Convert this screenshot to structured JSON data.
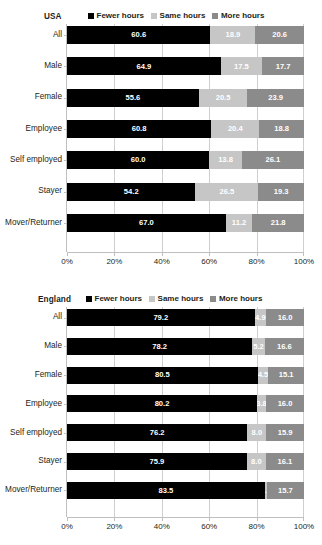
{
  "legend": {
    "items": [
      {
        "label": "Fewer hours",
        "color": "#000000",
        "key": "fewer"
      },
      {
        "label": "Same hours",
        "color": "#c6c6c6",
        "key": "same"
      },
      {
        "label": "More hours",
        "color": "#8b8b8b",
        "key": "more"
      }
    ]
  },
  "axis": {
    "ticklabels": [
      "0%",
      "20%",
      "40%",
      "60%",
      "80%",
      "100%"
    ],
    "ticks": [
      0,
      20,
      40,
      60,
      80,
      100
    ]
  },
  "chart_data": [
    {
      "type": "bar",
      "title": "USA",
      "orientation": "horizontal",
      "stacked": true,
      "stacked_100": true,
      "grid": true,
      "legend_position": "top",
      "xlabel": "",
      "ylabel": "",
      "xlim": [
        0,
        100
      ],
      "xticks": [
        0,
        20,
        40,
        60,
        80,
        100
      ],
      "xticklabels": [
        "0%",
        "20%",
        "40%",
        "60%",
        "80%",
        "100%"
      ],
      "categories": [
        "All",
        "Male",
        "Female",
        "Employee",
        "Self employed",
        "Stayer",
        "Mover/Returner"
      ],
      "series": [
        {
          "name": "Fewer hours",
          "color": "#000000",
          "values": [
            60.6,
            64.9,
            55.6,
            60.8,
            60.0,
            54.2,
            67.0
          ]
        },
        {
          "name": "Same hours",
          "color": "#c6c6c6",
          "values": [
            18.9,
            17.5,
            20.5,
            20.4,
            13.8,
            26.5,
            11.2
          ]
        },
        {
          "name": "More hours",
          "color": "#8b8b8b",
          "values": [
            20.6,
            17.7,
            23.9,
            18.8,
            26.1,
            19.3,
            21.8
          ]
        }
      ]
    },
    {
      "type": "bar",
      "title": "England",
      "orientation": "horizontal",
      "stacked": true,
      "stacked_100": true,
      "grid": true,
      "legend_position": "top",
      "xlabel": "",
      "ylabel": "",
      "xlim": [
        0,
        100
      ],
      "xticks": [
        0,
        20,
        40,
        60,
        80,
        100
      ],
      "xticklabels": [
        "0%",
        "20%",
        "40%",
        "60%",
        "80%",
        "100%"
      ],
      "categories": [
        "All",
        "Male",
        "Female",
        "Employee",
        "Self employed",
        "Stayer",
        "Mover/Returner"
      ],
      "series": [
        {
          "name": "Fewer hours",
          "color": "#000000",
          "values": [
            79.2,
            78.2,
            80.5,
            80.2,
            76.2,
            75.9,
            83.5
          ]
        },
        {
          "name": "Same hours",
          "color": "#c6c6c6",
          "values": [
            4.9,
            5.2,
            4.5,
            3.8,
            8.0,
            8.0,
            0.8
          ]
        },
        {
          "name": "More hours",
          "color": "#8b8b8b",
          "values": [
            16.0,
            16.6,
            15.1,
            16.0,
            15.9,
            16.1,
            15.7
          ]
        }
      ]
    }
  ]
}
